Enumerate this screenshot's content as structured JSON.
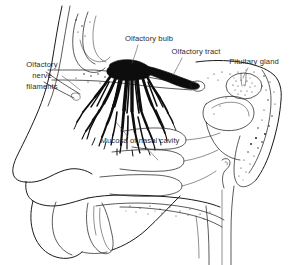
{
  "figure": {
    "background_color": "#ffffff",
    "line_color": "#1a1a1a",
    "label_color": "#2b2b2b",
    "leader_color": "#555555",
    "width": 296,
    "height": 265
  },
  "labels": {
    "olfactory_bulb": "Olfactory bulb",
    "olfactory_tract": "Olfactory tract",
    "pituitary_gland": "Pituitary gland",
    "mucosa": "Mucosa of nasal cavity",
    "nerve_filaments_line1": "Olfactory",
    "nerve_filaments_line2": "nerve",
    "nerve_filaments_line3": "filaments"
  },
  "structures": [
    {
      "name": "olfactory-bulb",
      "label": "Olfactory bulb",
      "fill": "#0d0d0d"
    },
    {
      "name": "olfactory-tract",
      "label": "Olfactory tract",
      "fill": "#0d0d0d"
    },
    {
      "name": "olfactory-nerve-filaments",
      "label": "Olfactory nerve filaments",
      "fill": "#0d0d0d"
    },
    {
      "name": "pituitary-gland",
      "label": "Pituitary gland",
      "fill": "#ffffff"
    },
    {
      "name": "nasal-mucosa",
      "label": "Mucosa of nasal cavity",
      "fill": "none"
    }
  ]
}
